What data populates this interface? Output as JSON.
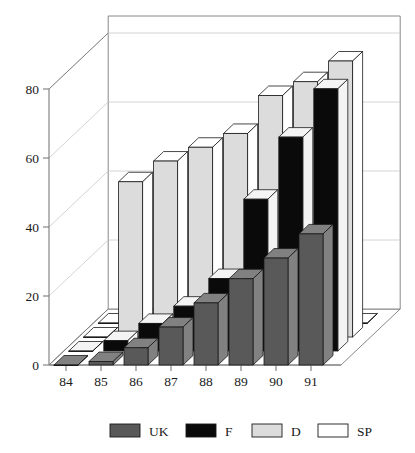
{
  "chart_data": {
    "type": "bar",
    "variant": "3d-grouped-bar",
    "title": "",
    "xlabel": "",
    "ylabel": "",
    "categories": [
      "84",
      "85",
      "86",
      "87",
      "88",
      "89",
      "90",
      "91"
    ],
    "ylim": [
      0,
      90
    ],
    "yticks": [
      0,
      20,
      40,
      60,
      80
    ],
    "ytick_labels": [
      "0",
      "20",
      "40",
      "60",
      "80"
    ],
    "grid": true,
    "legend_position": "bottom",
    "series": [
      {
        "name": "UK",
        "color": "#595959",
        "depth_index": 0,
        "values": [
          0,
          1,
          5,
          11,
          18,
          25,
          31,
          38
        ]
      },
      {
        "name": "F",
        "color": "#0a0a0a",
        "depth_index": 1,
        "values": [
          0,
          3,
          8,
          13,
          21,
          44,
          62,
          76
        ]
      },
      {
        "name": "D",
        "color": "#dcdcdc",
        "depth_index": 2,
        "values": [
          0,
          45,
          51,
          55,
          59,
          70,
          74,
          80
        ]
      },
      {
        "name": "SP",
        "color": "#ffffff",
        "depth_index": 3,
        "values": [
          0,
          0,
          0,
          0,
          0,
          0,
          0,
          0
        ]
      }
    ]
  },
  "axes": {
    "y_tick_labels": [
      "80",
      "60",
      "40",
      "20",
      "0"
    ],
    "x_tick_labels": [
      "84",
      "85",
      "86",
      "87",
      "88",
      "89",
      "90",
      "91"
    ]
  },
  "legend": {
    "items": [
      {
        "label": "UK",
        "swatch": "#595959"
      },
      {
        "label": "F",
        "swatch": "#0a0a0a"
      },
      {
        "label": "D",
        "swatch": "#dcdcdc"
      },
      {
        "label": "SP",
        "swatch": "#ffffff"
      }
    ]
  },
  "colors": {
    "axis": "#7a7a7a",
    "outline": "#1a1a1a",
    "grid": "#c9c9c9",
    "background": "#ffffff",
    "top_face_tint": "#f2f2f2",
    "side_face_tint": "#ffffff"
  }
}
